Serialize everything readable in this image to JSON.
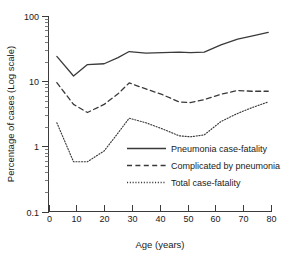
{
  "chart_data": {
    "type": "line",
    "title": "",
    "xlabel": "Age (years)",
    "ylabel": "Percentage of cases (Log scale)",
    "yscale": "log",
    "xlim": [
      0,
      80
    ],
    "ylim": [
      0.1,
      100
    ],
    "grid": false,
    "legend_position": "inside-lower-right",
    "x_ticks": [
      0,
      10,
      20,
      30,
      40,
      50,
      60,
      70,
      80
    ],
    "x_tick_labels": [
      "0",
      "10",
      "20",
      "30",
      "40",
      "50",
      "60",
      "70",
      "80"
    ],
    "y_ticks": [
      0.1,
      1,
      10,
      100
    ],
    "y_tick_labels": [
      "0.1",
      "1",
      "10",
      "100"
    ],
    "series": [
      {
        "name": "Pneumonia case-fatality",
        "style": "solid",
        "x": [
          3,
          9,
          14,
          20,
          25,
          29,
          35,
          41,
          47,
          51,
          56,
          62,
          68,
          73,
          79
        ],
        "values": [
          24,
          12,
          18,
          18.5,
          23,
          28.5,
          27,
          27.5,
          28,
          27.5,
          28,
          36,
          44,
          49,
          56
        ]
      },
      {
        "name": "Complicated by pneumonia",
        "style": "dashed",
        "x": [
          3,
          9,
          14,
          20,
          25,
          29,
          35,
          41,
          47,
          51,
          56,
          62,
          68,
          73,
          79
        ],
        "values": [
          9.5,
          4.4,
          3.3,
          4.4,
          6.4,
          9.4,
          7.6,
          6.2,
          4.8,
          4.7,
          5.2,
          6.3,
          7.2,
          7.0,
          7.0
        ]
      },
      {
        "name": "Total case-fatality",
        "style": "dotted",
        "x": [
          3,
          9,
          14,
          20,
          25,
          29,
          35,
          41,
          47,
          51,
          56,
          62,
          68,
          73,
          79
        ],
        "values": [
          2.3,
          0.58,
          0.58,
          0.85,
          1.6,
          2.7,
          2.3,
          1.85,
          1.45,
          1.4,
          1.5,
          2.4,
          3.2,
          3.9,
          4.8
        ]
      }
    ]
  },
  "legend": {
    "items": [
      {
        "label": "Pneumonia case-fatality",
        "style": "solid"
      },
      {
        "label": "Complicated by pneumonia",
        "style": "dashed"
      },
      {
        "label": "Total case-fatality",
        "style": "dotted"
      }
    ]
  },
  "colors": {
    "line": "#3a3a3a",
    "axis": "#3b3b3b",
    "text": "#1a1a1a",
    "background": "#ffffff"
  }
}
